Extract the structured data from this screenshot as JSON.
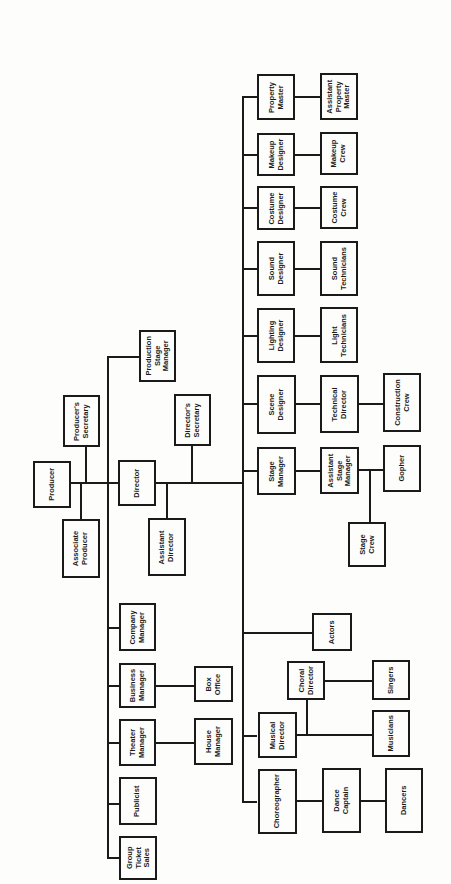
{
  "diagram": {
    "type": "org-chart",
    "orientation": "rotated-90-ccw",
    "colors": {
      "line": "#1a1a1a",
      "background": "#fdfdfb"
    },
    "nodes": {
      "producer": "Producer",
      "producers_secretary": "Producer's\nSecretary",
      "associate_producer": "Associate\nProducer",
      "production_stage_manager": "Production\nStage\nManager",
      "director": "Director",
      "directors_secretary": "Director's\nSecretary",
      "assistant_director": "Assistant\nDirector",
      "company_manager": "Company\nManager",
      "business_manager": "Business\nManager",
      "box_office": "Box\nOffice",
      "theater_manager": "Theater\nManager",
      "house_manager": "House\nManager",
      "publicist": "Publicist",
      "group_ticket_sales": "Group\nTicket\nSales",
      "property_master": "Property\nMaster",
      "assistant_property_master": "Assistant\nProperty\nMaster",
      "makeup_designer": "Makeup\nDesigner",
      "makeup_crew": "Makeup\nCrew",
      "costume_designer": "Costume\nDesigner",
      "costume_crew": "Costume\nCrew",
      "sound_designer": "Sound\nDesigner",
      "sound_technicians": "Sound\nTechnicians",
      "lighting_designer": "Lighting\nDesigner",
      "light_technicians": "Light\nTechnicians",
      "scene_designer": "Scene\nDesigner",
      "technical_director": "Technical\nDirector",
      "construction_crew": "Construction\nCrew",
      "stage_manager": "Stage\nManager",
      "assistant_stage_manager": "Assistant\nStage\nManager",
      "gopher": "Gopher",
      "stage_crew": "Stage\nCrew",
      "actors": "Actors",
      "choral_director": "Choral\nDirector",
      "singers": "Singers",
      "musical_director": "Musical\nDirector",
      "musicians": "Musicians",
      "choreographer": "Choreographer",
      "dance_captain": "Dance\nCaptain",
      "dancers": "Dancers"
    },
    "hierarchy": {
      "Producer": [
        "Producer's Secretary",
        "Associate Producer",
        "Production Stage Manager",
        "Director",
        "Company Manager",
        "Business Manager",
        "Theater Manager",
        "Publicist",
        "Group Ticket Sales"
      ],
      "Business Manager": [
        "Box Office"
      ],
      "Theater Manager": [
        "House Manager"
      ],
      "Director": [
        "Director's Secretary",
        "Assistant Director",
        "Property Master",
        "Makeup Designer",
        "Costume Designer",
        "Sound Designer",
        "Lighting Designer",
        "Scene Designer",
        "Stage Manager",
        "Actors",
        "Musical Director",
        "Choreographer"
      ],
      "Property Master": [
        "Assistant Property Master"
      ],
      "Makeup Designer": [
        "Makeup Crew"
      ],
      "Costume Designer": [
        "Costume Crew"
      ],
      "Sound Designer": [
        "Sound Technicians"
      ],
      "Lighting Designer": [
        "Light Technicians"
      ],
      "Scene Designer": [
        "Technical Director"
      ],
      "Technical Director": [
        "Construction Crew"
      ],
      "Stage Manager": [
        "Assistant Stage Manager"
      ],
      "Assistant Stage Manager": [
        "Gopher",
        "Stage Crew"
      ],
      "Musical Director": [
        "Choral Director",
        "Musicians"
      ],
      "Choral Director": [
        "Singers"
      ],
      "Choreographer": [
        "Dance Captain"
      ],
      "Dance Captain": [
        "Dancers"
      ]
    }
  }
}
